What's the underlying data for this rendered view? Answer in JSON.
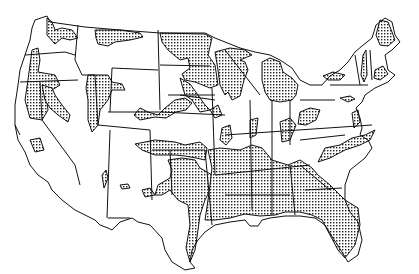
{
  "map": {
    "type": "us-states-outline",
    "style": "black line art with stippled (dotted) shaded regions",
    "colors": {
      "background": "#ffffff",
      "outline": "#111111",
      "stipple_dot": "#222222"
    },
    "shaded_regions": [
      "northern Washington / Idaho panhandle",
      "northern Montana",
      "western Oregon / northern California",
      "eastern Oregon / Nevada",
      "Idaho / Utah",
      "Colorado / Wyoming border",
      "Minnesota",
      "Wisconsin / Upper Michigan",
      "Lower Michigan",
      "Iowa / Missouri patches",
      "Kansas / Oklahoma",
      "east Texas / Louisiana / Gulf coast",
      "Mississippi / Alabama / Georgia",
      "Florida",
      "Carolinas / Virginia coast",
      "New York / New England patches",
      "Maine"
    ]
  }
}
